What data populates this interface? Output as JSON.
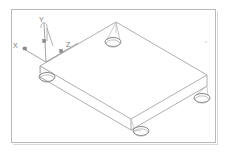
{
  "document": {
    "title": "3D wireframe isometric view",
    "subject": "rectangular plate with four corner holes",
    "background_color": "#ffffff",
    "frame_color": "#b9b9b9",
    "line_color": "#9a9a9a",
    "hole_color": "#7b7b7b"
  },
  "viewport": {
    "width": 227,
    "height": 156,
    "frame": {
      "x": 11,
      "y": 9,
      "width": 205,
      "height": 134
    }
  },
  "axis_triad": {
    "origin": {
      "x": 46,
      "y": 62
    },
    "axes": [
      {
        "name": "x-axis",
        "label": "X",
        "label_x": 13,
        "label_y": 45,
        "end_x": 22,
        "end_y": 48,
        "marker_x": 25,
        "marker_y": 50
      },
      {
        "name": "y-axis",
        "label": "Y",
        "label_x": 40,
        "label_y": 20,
        "end_x": 44,
        "end_y": 23,
        "marker_x": 44,
        "marker_y": 41
      },
      {
        "name": "z-axis",
        "label": "Z",
        "label_x": 66,
        "label_y": 46,
        "end_x": 72,
        "end_y": 43,
        "marker_x": 61,
        "marker_y": 51
      }
    ]
  },
  "geometry": {
    "plate": {
      "name": "rectangular-plate",
      "thickness_px": 11,
      "top_face_corners": [
        {
          "name": "corner-left",
          "x": 40,
          "y": 66
        },
        {
          "name": "corner-top",
          "x": 116,
          "y": 22
        },
        {
          "name": "corner-right",
          "x": 207,
          "y": 75
        },
        {
          "name": "corner-bottom",
          "x": 131,
          "y": 119
        }
      ],
      "bottom_face_corners": [
        {
          "name": "corner-left-lower",
          "x": 40,
          "y": 77
        },
        {
          "name": "corner-right-lower",
          "x": 207,
          "y": 86
        },
        {
          "name": "corner-bottom-lower",
          "x": 131,
          "y": 130
        }
      ]
    },
    "holes": [
      {
        "name": "hole-top",
        "cx": 113,
        "cy": 42,
        "rx": 8,
        "ry": 4.5
      },
      {
        "name": "hole-left",
        "cx": 47,
        "cy": 77,
        "rx": 8,
        "ry": 4.5
      },
      {
        "name": "hole-right",
        "cx": 202,
        "cy": 98,
        "rx": 8,
        "ry": 4.5
      },
      {
        "name": "hole-bottom",
        "cx": 141,
        "cy": 131,
        "rx": 8,
        "ry": 4.5
      }
    ]
  },
  "annotations": {
    "speck": {
      "name": "stray-speck",
      "x": 206,
      "y": 42
    }
  }
}
